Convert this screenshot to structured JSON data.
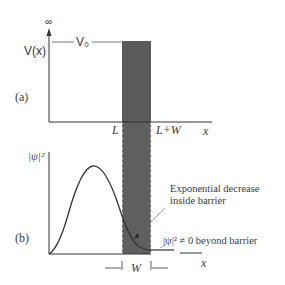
{
  "figure": {
    "panel_a": {
      "label": "(a)",
      "y_axis_label": "V(x)",
      "infinity_symbol": "∞",
      "level_label": "V₀",
      "x_axis_label": "x",
      "barrier_left_label": "L",
      "barrier_right_label": "L+W"
    },
    "panel_b": {
      "label": "(b)",
      "y_axis_label": "|ψ|²",
      "x_axis_label": "x",
      "width_label": "W",
      "annotation_inside": [
        "Exponential decrease",
        "inside barrier"
      ],
      "annotation_beyond": "|ψ|² ≠ 0 beyond barrier"
    },
    "colors": {
      "barrier_fill": "#5a5a5a",
      "line": "#333333",
      "text": "#3a3a3a"
    }
  }
}
